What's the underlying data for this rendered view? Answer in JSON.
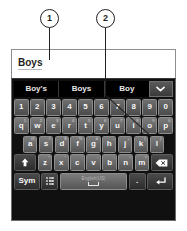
{
  "callouts": [
    {
      "number": "1",
      "name": "text-field-callout"
    },
    {
      "number": "2",
      "name": "keyboard-callout"
    }
  ],
  "text_field": {
    "value": "Boys",
    "placeholder": "",
    "cursor": "|"
  },
  "suggestions": {
    "items": [
      "Boy's",
      "Boys",
      "Boy"
    ],
    "expand_icon": "chevron-down-icon"
  },
  "keyboard": {
    "number_row": [
      "1",
      "2",
      "3",
      "4",
      "5",
      "6",
      "7",
      "8",
      "9",
      "0"
    ],
    "row_qwerty": [
      {
        "key": "q",
        "alt": "1"
      },
      {
        "key": "w",
        "alt": "2"
      },
      {
        "key": "e",
        "alt": "3"
      },
      {
        "key": "r",
        "alt": "4"
      },
      {
        "key": "t",
        "alt": "5"
      },
      {
        "key": "y",
        "alt": "6"
      },
      {
        "key": "u",
        "alt": "7"
      },
      {
        "key": "i",
        "alt": "8"
      },
      {
        "key": "o",
        "alt": "9"
      },
      {
        "key": "p",
        "alt": "0"
      }
    ],
    "row_asdf": [
      {
        "key": "a",
        "alt": "@"
      },
      {
        "key": "s",
        "alt": "#"
      },
      {
        "key": "d",
        "alt": "$"
      },
      {
        "key": "f",
        "alt": "%"
      },
      {
        "key": "g",
        "alt": "&"
      },
      {
        "key": "h",
        "alt": "-"
      },
      {
        "key": "j",
        "alt": "+"
      },
      {
        "key": "k",
        "alt": "("
      },
      {
        "key": "l",
        "alt": ")"
      }
    ],
    "row_zxcv": [
      {
        "key": "z",
        "alt": "*"
      },
      {
        "key": "x",
        "alt": "\""
      },
      {
        "key": "c",
        "alt": "'"
      },
      {
        "key": "v",
        "alt": ":"
      },
      {
        "key": "b",
        "alt": ";"
      },
      {
        "key": "n",
        "alt": "!"
      },
      {
        "key": "m",
        "alt": "?"
      }
    ],
    "shift_key": {
      "label": "",
      "icon": "shift-arrow-icon"
    },
    "backspace_key": {
      "label": "",
      "icon": "backspace-icon"
    },
    "bottom_row": {
      "sym_key": "Sym",
      "settings_key_icon": "keyboard-settings-icon",
      "space_key": {
        "label": "English(US)",
        "icon": "space-bar-icon"
      },
      "period_key": ".",
      "enter_key_icon": "enter-arrow-icon"
    }
  },
  "colors": {
    "keyboard_bg": "#101010",
    "key_face": "#6b6b6b",
    "key_dark": "#3a3a3a",
    "suggestion_bg": "#000000",
    "text_light": "#ffffff",
    "callout_stroke": "#231f20",
    "field_bg": "#ffffff"
  }
}
